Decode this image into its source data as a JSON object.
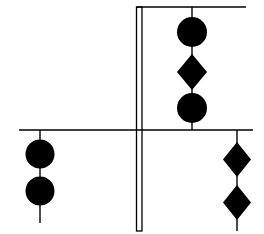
{
  "diagram": {
    "type": "signal-shapes-on-mast",
    "width": 264,
    "height": 234,
    "background": "#ffffff",
    "ink": "#000000",
    "mast": {
      "x_left": 136.5,
      "x_right": 142,
      "top": 7,
      "bottom": 231
    },
    "gaff": {
      "y": 7,
      "x1": 136.5,
      "x2": 246
    },
    "yard": {
      "y": 130,
      "x1": 19,
      "x2": 253
    },
    "hoists": [
      {
        "id": "upper-hoist",
        "x": 192,
        "line_top": 7,
        "line_bottom": 130,
        "shapes": [
          {
            "kind": "ball",
            "cy": 32,
            "r": 15
          },
          {
            "kind": "diamond",
            "cy": 72,
            "half_w": 15,
            "half_h": 18
          },
          {
            "kind": "ball",
            "cy": 108,
            "r": 15
          }
        ]
      },
      {
        "id": "left-yardarm-hoist",
        "x": 40,
        "line_top": 130,
        "line_bottom": 223,
        "shapes": [
          {
            "kind": "ball",
            "cy": 154,
            "r": 14.5
          },
          {
            "kind": "ball",
            "cy": 191,
            "r": 14.5
          }
        ]
      },
      {
        "id": "right-yardarm-hoist",
        "x": 237,
        "line_top": 130,
        "line_bottom": 231,
        "shapes": [
          {
            "kind": "diamond",
            "cy": 159.5,
            "half_w": 14,
            "half_h": 17.5
          },
          {
            "kind": "diamond",
            "cy": 202.5,
            "half_w": 14,
            "half_h": 17.5
          }
        ]
      }
    ]
  }
}
